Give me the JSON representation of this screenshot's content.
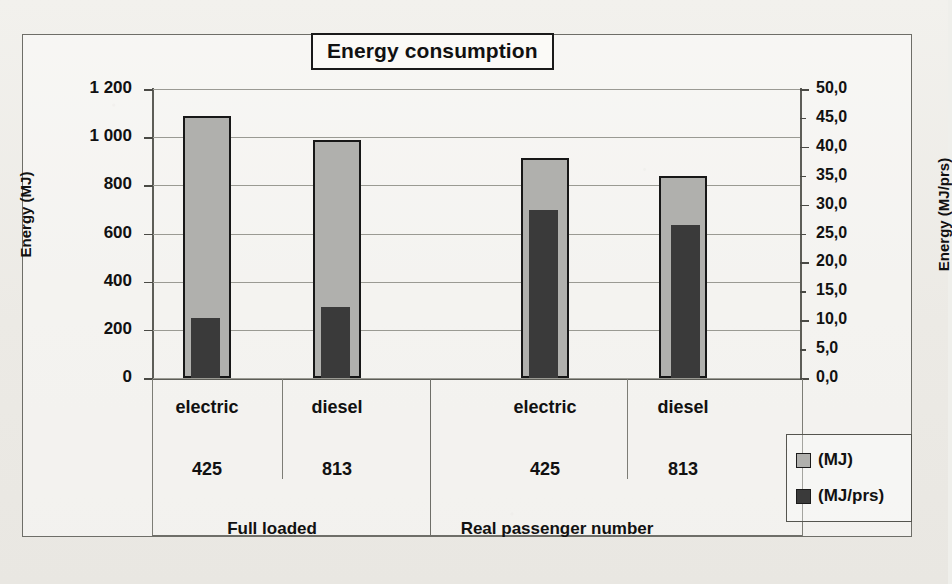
{
  "chart_data": {
    "type": "bar",
    "title": "Energy consumption",
    "xlabel": "",
    "ylabel": "Energy (MJ)",
    "y2label": "Energy (MJ/prs)",
    "ylim": [
      0,
      1200
    ],
    "y2lim": [
      0,
      50
    ],
    "grid": true,
    "legend_position": "right",
    "categories": [
      "electric",
      "diesel",
      "electric",
      "diesel"
    ],
    "category_numbers": [
      "425",
      "813",
      "425",
      "813"
    ],
    "groups": [
      {
        "label": "Full loaded",
        "categories": [
          "electric",
          "diesel"
        ],
        "numbers": [
          "425",
          "813"
        ]
      },
      {
        "label": "Real passenger number",
        "categories": [
          "electric",
          "diesel"
        ],
        "numbers": [
          "425",
          "813"
        ]
      }
    ],
    "series": [
      {
        "name": "(MJ)",
        "axis": "left",
        "color": "#b0b0ad",
        "values": [
          1090,
          990,
          915,
          840
        ]
      },
      {
        "name": "(MJ/prs)",
        "axis": "right",
        "color": "#3a3a3a",
        "values": [
          10.4,
          12.3,
          29.0,
          26.5
        ]
      }
    ],
    "yticks": [
      "0",
      "200",
      "400",
      "600",
      "800",
      "1 000",
      "1 200"
    ],
    "ytick_values": [
      0,
      200,
      400,
      600,
      800,
      1000,
      1200
    ],
    "y2ticks": [
      "0,0",
      "5,0",
      "10,0",
      "15,0",
      "20,0",
      "25,0",
      "30,0",
      "35,0",
      "40,0",
      "45,0",
      "50,0"
    ],
    "y2tick_values": [
      0,
      5,
      10,
      15,
      20,
      25,
      30,
      35,
      40,
      45,
      50
    ],
    "legend": [
      {
        "label": "(MJ)",
        "swatch": "light-gray-swatch-icon",
        "color": "#b0b0ad"
      },
      {
        "label": "(MJ/prs)",
        "swatch": "dark-gray-swatch-icon",
        "color": "#3a3a3a"
      }
    ]
  },
  "colors": {
    "series_mj": "#b0b0ad",
    "series_mj_prs": "#3a3a3a",
    "frame": "#6e6e68",
    "grid": "#9a9a93",
    "text": "#111111",
    "paper": "#efefeb"
  }
}
